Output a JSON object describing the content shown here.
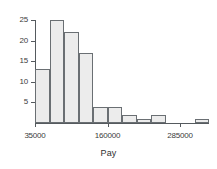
{
  "chart_data": {
    "type": "bar",
    "title": "",
    "subtitle": "",
    "xlabel": "Pay",
    "ylabel": "",
    "grid": false,
    "legend": null,
    "bin_width": 25000,
    "x_start": 35000,
    "categories": [
      "35000-60000",
      "60000-85000",
      "85000-110000",
      "110000-135000",
      "135000-160000",
      "160000-185000",
      "185000-210000",
      "210000-235000",
      "235000-260000",
      "260000-285000",
      "285000-310000",
      "310000-335000"
    ],
    "values": [
      13,
      25,
      22,
      17,
      4,
      4,
      2,
      1,
      2,
      0,
      0,
      1
    ],
    "xlim": [
      35000,
      335000
    ],
    "ylim": [
      0,
      26
    ],
    "x_tick_labels": [
      "35000",
      "160000",
      "285000"
    ],
    "x_tick_values": [
      35000,
      160000,
      285000
    ],
    "y_tick_labels": [
      "5",
      "10",
      "15",
      "20",
      "25"
    ],
    "y_tick_values": [
      5,
      10,
      15,
      20,
      25
    ],
    "colors": {
      "bar_fill": "#ececec",
      "bar_stroke": "#6a6f73",
      "axis": "#555a5e",
      "text": "#3c3c3c",
      "background": "#ffffff"
    }
  },
  "axis": {
    "x_title": "Pay"
  }
}
